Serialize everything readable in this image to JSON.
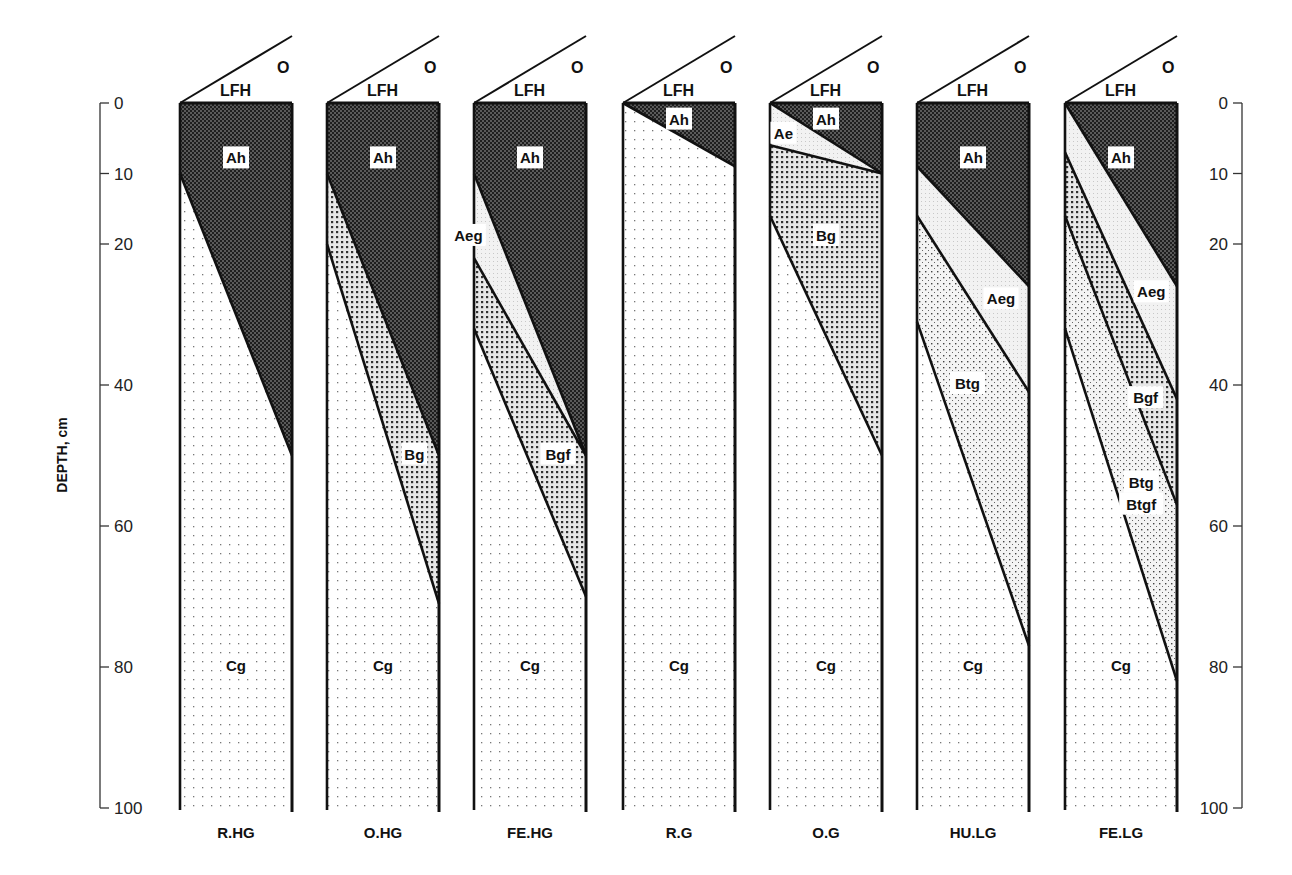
{
  "axis": {
    "label": "DEPTH, cm",
    "ticks": [
      0,
      10,
      20,
      40,
      60,
      80,
      100
    ],
    "min": 0,
    "max": 100
  },
  "surface_labels": {
    "organic": "O",
    "litter": "LFH"
  },
  "colors": {
    "outline": "#111111",
    "Ah": "#4a4a4a",
    "Ae": "#e6e6e6",
    "Bg": "#9a9a9a",
    "Bt": "#cfcfcf",
    "Cg": "#f6f6f6"
  },
  "profiles": [
    {
      "name": "R.HG",
      "horizons": [
        {
          "label": "Ah",
          "type": "Ah",
          "bottom": [
            10,
            50
          ],
          "label_pos": [
            0.5,
            8
          ]
        },
        {
          "label": "Cg",
          "type": "Cg",
          "bottom": [
            100,
            100
          ],
          "label_pos": [
            0.5,
            80
          ]
        }
      ]
    },
    {
      "name": "O.HG",
      "horizons": [
        {
          "label": "Ah",
          "type": "Ah",
          "bottom": [
            10,
            50
          ],
          "label_pos": [
            0.5,
            8
          ]
        },
        {
          "label": "Bg",
          "type": "Bg",
          "bottom": [
            20,
            71
          ],
          "label_pos": [
            0.78,
            50
          ]
        },
        {
          "label": "Cg",
          "type": "Cg",
          "bottom": [
            100,
            100
          ],
          "label_pos": [
            0.5,
            80
          ]
        }
      ]
    },
    {
      "name": "FE.HG",
      "horizons": [
        {
          "label": "Ah",
          "type": "Ah",
          "bottom": [
            10,
            50
          ],
          "label_pos": [
            0.5,
            8
          ]
        },
        {
          "label": "Aeg",
          "type": "Ae",
          "bottom": [
            22,
            50
          ],
          "label_pos": [
            -0.05,
            19
          ]
        },
        {
          "label": "Bgf",
          "type": "Bg",
          "bottom": [
            32,
            70
          ],
          "label_pos": [
            0.75,
            50
          ]
        },
        {
          "label": "Cg",
          "type": "Cg",
          "bottom": [
            100,
            100
          ],
          "label_pos": [
            0.5,
            80
          ]
        }
      ]
    },
    {
      "name": "R.G",
      "horizons": [
        {
          "label": "Ah",
          "type": "Ah",
          "bottom": [
            0,
            9
          ],
          "label_pos": [
            0.5,
            2.5
          ]
        },
        {
          "label": "Cg",
          "type": "Cg",
          "bottom": [
            100,
            100
          ],
          "label_pos": [
            0.5,
            80
          ]
        }
      ]
    },
    {
      "name": "O.G",
      "horizons": [
        {
          "label": "Ah",
          "type": "Ah",
          "bottom": [
            0,
            10
          ],
          "label_pos": [
            0.5,
            2.5
          ]
        },
        {
          "label": "Ae",
          "type": "Ae",
          "bottom": [
            6,
            10
          ],
          "label_pos": [
            0.12,
            4.5
          ]
        },
        {
          "label": "Bg",
          "type": "Bg",
          "bottom": [
            16,
            50
          ],
          "label_pos": [
            0.5,
            19
          ]
        },
        {
          "label": "Cg",
          "type": "Cg",
          "bottom": [
            100,
            100
          ],
          "label_pos": [
            0.5,
            80
          ]
        }
      ]
    },
    {
      "name": "HU.LG",
      "horizons": [
        {
          "label": "Ah",
          "type": "Ah",
          "bottom": [
            9,
            26
          ],
          "label_pos": [
            0.5,
            8
          ]
        },
        {
          "label": "Aeg",
          "type": "Ae",
          "bottom": [
            16,
            41
          ],
          "label_pos": [
            0.75,
            28
          ]
        },
        {
          "label": "Btg",
          "type": "Bt",
          "bottom": [
            31,
            77
          ],
          "label_pos": [
            0.45,
            40
          ]
        },
        {
          "label": "Cg",
          "type": "Cg",
          "bottom": [
            100,
            100
          ],
          "label_pos": [
            0.5,
            80
          ]
        }
      ]
    },
    {
      "name": "FE.LG",
      "horizons": [
        {
          "label": "Ah",
          "type": "Ah",
          "bottom": [
            0,
            26
          ],
          "label_pos": [
            0.5,
            8
          ]
        },
        {
          "label": "Aeg",
          "type": "Ae",
          "bottom": [
            7,
            42
          ],
          "label_pos": [
            0.77,
            27
          ]
        },
        {
          "label": "Bgf",
          "type": "Bg",
          "bottom": [
            16,
            57
          ],
          "label_pos": [
            0.72,
            42
          ]
        },
        {
          "label": "Btg\nBtgf",
          "type": "Bt",
          "bottom": [
            32,
            82
          ],
          "label_pos": [
            0.68,
            54
          ]
        },
        {
          "label": "Cg",
          "type": "Cg",
          "bottom": [
            100,
            100
          ],
          "label_pos": [
            0.5,
            80
          ]
        }
      ]
    }
  ]
}
